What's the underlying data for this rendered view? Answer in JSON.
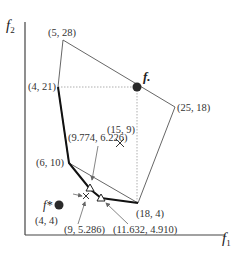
{
  "axes": {
    "x_label": "f",
    "x_sub": "1",
    "y_label": "f",
    "y_sub": "2"
  },
  "colors": {
    "axis": "#444444",
    "polygon": "#555555",
    "pareto_front": "#111111",
    "guide": "#9a9a9a",
    "point": "#2a2a2a",
    "arrow": "#666666"
  },
  "vertices": {
    "v1": "(5, 28)",
    "v2": "(4, 21)",
    "v3": "(25, 18)",
    "v4": "(6, 10)",
    "v5": "(18, 4)"
  },
  "points": {
    "ideal_label": "f*",
    "ideal_coord": "(4, 4)",
    "f_dot_label": "f.",
    "interior": "(15, 9)",
    "tri1": "(9.774, 6.226)",
    "cross1": "(9, 5.286)",
    "tri2": "(11.632, 4.910)"
  }
}
